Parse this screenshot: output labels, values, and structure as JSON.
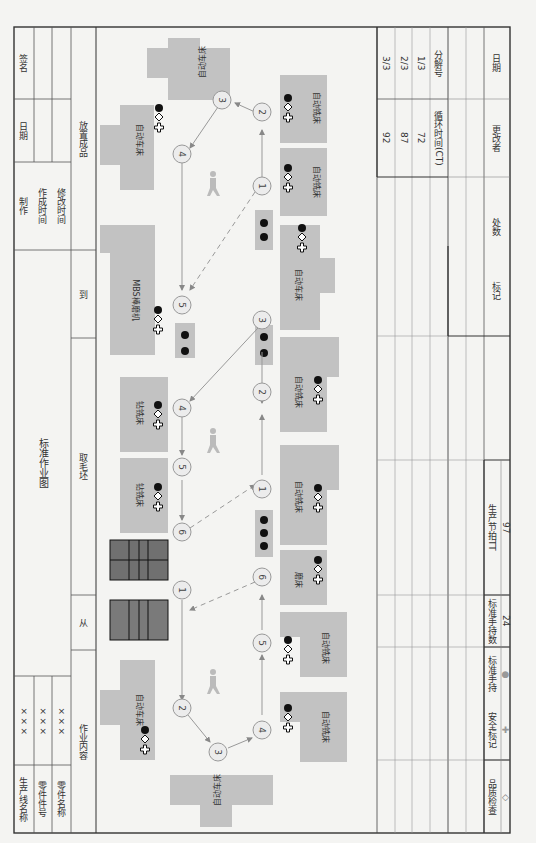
{
  "header": {
    "title": "标准作业图",
    "fields": [
      {
        "label": "生产线名称",
        "value": "×××"
      },
      {
        "label": "零件件号",
        "value": "×××"
      },
      {
        "label": "零件名称",
        "value": "×××"
      }
    ],
    "signoff": {
      "make": "制作",
      "date": "日期",
      "sign": "签名",
      "created": "作成时间",
      "modified": "修改时间"
    },
    "content_row": {
      "label": "作业内容",
      "from": "从",
      "take_blank": "取毛坯",
      "to": "到",
      "place_finished": "放置成品"
    }
  },
  "machines": [
    {
      "name": "自动车床",
      "symbols": [
        "dot",
        "diamond",
        "cross"
      ]
    },
    {
      "name": "自动车床",
      "symbols": [
        "dot",
        "diamond",
        "cross"
      ]
    },
    {
      "name": "MBS棒磨机",
      "symbols": [
        "dot",
        "diamond",
        "cross"
      ]
    },
    {
      "name": "钻铣床",
      "symbols": [
        "dot",
        "diamond",
        "cross"
      ]
    },
    {
      "name": "钻铣床",
      "symbols": [
        "dot",
        "diamond",
        "cross"
      ]
    },
    {
      "name": "自动车床",
      "symbols": [
        "dot",
        "diamond",
        "cross"
      ]
    },
    {
      "name": "自动车床",
      "symbols": [
        "dot",
        "cross"
      ]
    },
    {
      "name": "自动铣床",
      "symbols": [
        "dot",
        "diamond",
        "cross"
      ]
    },
    {
      "name": "自动铣床",
      "symbols": [
        "dot",
        "diamond",
        "cross"
      ]
    },
    {
      "name": "自动车床",
      "symbols": [
        "dot",
        "diamond",
        "cross"
      ]
    },
    {
      "name": "自动铣床",
      "symbols": [
        "dot",
        "diamond",
        "cross"
      ]
    },
    {
      "name": "自动铣床",
      "symbols": [
        "dot",
        "diamond",
        "cross"
      ]
    },
    {
      "name": "磨床",
      "symbols": [
        "dot",
        "diamond",
        "cross"
      ]
    },
    {
      "name": "自动铣床",
      "symbols": [
        "dot",
        "diamond",
        "cross"
      ]
    },
    {
      "name": "自动铣床",
      "symbols": [
        "dot",
        "diamond",
        "cross"
      ]
    },
    {
      "name": "自动车床",
      "symbols": [
        "dot",
        "cross"
      ]
    }
  ],
  "steps": {
    "loop_top_left": [
      "1",
      "2",
      "3",
      "4",
      "5",
      "6"
    ],
    "loop_top_right": [
      "1",
      "2",
      "3",
      "4",
      "5"
    ],
    "loop_bottom_left": [
      "1",
      "2",
      "3"
    ],
    "loop_bottom_right": [
      "1",
      "2",
      "3",
      "4",
      "5",
      "6"
    ]
  },
  "cycle_table": {
    "ct_header": "循环时间(CT)",
    "part_header": "分解号",
    "rows": [
      {
        "ct": "92",
        "part": "3/3"
      },
      {
        "ct": "87",
        "part": "2/3"
      },
      {
        "ct": "72",
        "part": "1/3"
      }
    ]
  },
  "revision": {
    "mark": "标记",
    "count": "处数",
    "editor": "更改者",
    "date": "日期"
  },
  "legend": [
    {
      "label": "品质检查",
      "symbol": "◇"
    },
    {
      "label": "安全标记",
      "symbol": "✚"
    },
    {
      "label": "标准手持",
      "symbol": "●"
    },
    {
      "label": "标准手持数",
      "value": "24"
    },
    {
      "label": "生产节拍TT",
      "value": "97"
    }
  ],
  "colors": {
    "machine": "#c2c2c2",
    "wip_grid": "#707070",
    "circle": "#ececec",
    "line": "#999999",
    "frame": "#333333"
  }
}
